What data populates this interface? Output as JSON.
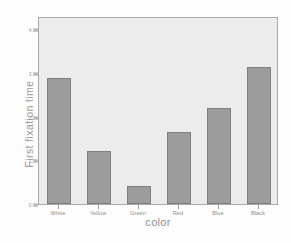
{
  "chart_data": {
    "type": "bar",
    "title": "",
    "xlabel": "color",
    "ylabel": "First fixation time",
    "categories": [
      "White",
      "Yellow",
      "Green",
      "Red",
      "Blue",
      "Black"
    ],
    "values": [
      2.88,
      1.21,
      0.42,
      1.65,
      2.19,
      3.14
    ],
    "ylim": [
      0.0,
      4.3
    ],
    "yticks": [
      0.0,
      1.0,
      2.0,
      3.0,
      4.0
    ],
    "ytick_labels": [
      "0.00",
      "1.00",
      "2.00",
      "3.00",
      "4.00"
    ],
    "grid": false,
    "legend": null,
    "colors": {
      "bar_fill": "#9c9c9c",
      "bar_edge": "#7e7e7e",
      "plot_background": "#ececec",
      "frame": "#a8a8a8",
      "text": "#8d8d8d",
      "figure_background": "#fdfdfd"
    }
  }
}
